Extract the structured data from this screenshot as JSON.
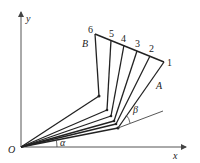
{
  "labels": {
    "y_axis": "y",
    "x_axis": "x",
    "origin": "O",
    "point_A": "A",
    "point_B": "B",
    "angle_alpha": "α",
    "angle_beta": "β",
    "positions": [
      "1",
      "2",
      "3",
      "4",
      "5",
      "6"
    ]
  },
  "colors": {
    "line": "#222222",
    "axis": "#555555",
    "background": "#ffffff"
  }
}
